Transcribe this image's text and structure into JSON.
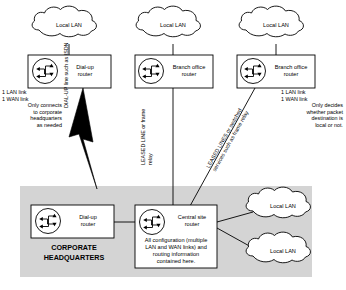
{
  "diagram": {
    "colors": {
      "background": "#ffffff",
      "stroke": "#000000",
      "shaded_region": "#d4d4d4",
      "box_fill": "#ffffff",
      "bolt_fill": "#000000"
    },
    "clouds": [
      {
        "id": "cloud-top-left",
        "label": "Local LAN"
      },
      {
        "id": "cloud-top-middle",
        "label": "Local LAN"
      },
      {
        "id": "cloud-top-right",
        "label": "Local LAN"
      },
      {
        "id": "cloud-hq-upper",
        "label": "Local LAN"
      },
      {
        "id": "cloud-hq-lower",
        "label": "Local LAN"
      }
    ],
    "routers": [
      {
        "id": "router-dialup-remote",
        "icon": "router-icon",
        "label_line1": "Dial-up",
        "label_line2": "router"
      },
      {
        "id": "router-branch-middle",
        "icon": "router-icon",
        "label_line1": "Branch office",
        "label_line2": "router"
      },
      {
        "id": "router-branch-right",
        "icon": "router-icon",
        "label_line1": "Branch office",
        "label_line2": "router"
      },
      {
        "id": "router-dialup-hq",
        "icon": "router-icon",
        "label_line1": "Dial-up",
        "label_line2": "router"
      },
      {
        "id": "router-central-site",
        "icon": "router-icon",
        "label_line1": "Central site",
        "label_line2": "router",
        "note_lines": [
          "All configuration (multiple",
          "LAN and WAN links) and",
          "routing information",
          "contained here."
        ]
      }
    ],
    "annotations": {
      "left_router_notes": [
        "1 LAN link",
        "1 WAN link",
        "Only connects",
        "to corporate",
        "headquarters",
        "as needed"
      ],
      "right_router_notes": [
        "1 LAN link",
        "1 WAN link",
        "Only decides",
        "whether packet",
        "destination is",
        "local or not."
      ]
    },
    "link_labels": {
      "dialup_line": "DIAL-UP line such as ISDN",
      "leased_line_middle_l1": "LEASED LINE or frame",
      "leased_line_middle_l2": "relay",
      "leased_lines_right_l1": "LEASED LINES or switched",
      "leased_lines_right_l2": "services such as frame relay"
    },
    "region": {
      "label_line1": "CORPORATE",
      "label_line2": "HEADQUARTERS"
    }
  }
}
